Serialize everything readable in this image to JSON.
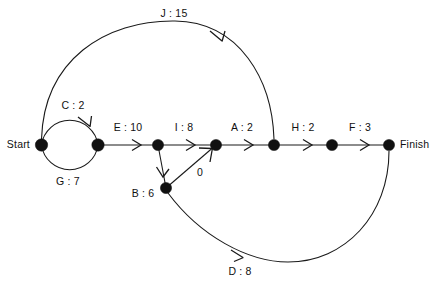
{
  "diagram": {
    "background_color": "#ffffff",
    "line_color": "#1a1a1a",
    "node_color": "#111111",
    "terminals": {
      "start_label": "Start",
      "finish_label": "Finish"
    },
    "nodes": [
      {
        "id": "start",
        "name": "start-node",
        "x": 41,
        "y": 145,
        "r": 6.0
      },
      {
        "id": "n2",
        "name": "node-2",
        "x": 98,
        "y": 145,
        "r": 6.0
      },
      {
        "id": "n3",
        "name": "node-3",
        "x": 158,
        "y": 145,
        "r": 5.5
      },
      {
        "id": "n4",
        "name": "node-4",
        "x": 216,
        "y": 145,
        "r": 5.5
      },
      {
        "id": "n5",
        "name": "node-5",
        "x": 274,
        "y": 145,
        "r": 5.5
      },
      {
        "id": "n6",
        "name": "node-6",
        "x": 332,
        "y": 145,
        "r": 5.5
      },
      {
        "id": "finish",
        "name": "finish-node",
        "x": 389,
        "y": 145,
        "r": 5.5
      },
      {
        "id": "nb",
        "name": "node-b",
        "x": 166,
        "y": 188,
        "r": 5.5
      }
    ],
    "edges": [
      {
        "id": "C",
        "label": "C : 2",
        "from": "start",
        "to": "n2",
        "shape": "arc-top-circle"
      },
      {
        "id": "G",
        "label": "G : 7",
        "from": "start",
        "to": "n2",
        "shape": "arc-bottom-circle"
      },
      {
        "id": "J",
        "label": "J : 15",
        "from": "start",
        "to": "n5",
        "shape": "arc-large-top"
      },
      {
        "id": "E",
        "label": "E : 10",
        "from": "n2",
        "to": "n3",
        "shape": "straight"
      },
      {
        "id": "I",
        "label": "I : 8",
        "from": "n3",
        "to": "n4",
        "shape": "straight"
      },
      {
        "id": "A",
        "label": "A : 2",
        "from": "n4",
        "to": "n5",
        "shape": "straight"
      },
      {
        "id": "H",
        "label": "H : 2",
        "from": "n5",
        "to": "n6",
        "shape": "straight"
      },
      {
        "id": "F",
        "label": "F : 3",
        "from": "n6",
        "to": "finish",
        "shape": "straight"
      },
      {
        "id": "B",
        "label": "B : 6",
        "from": "n3",
        "to": "nb",
        "shape": "straight-diagonal"
      },
      {
        "id": "Z",
        "label": "0",
        "from": "nb",
        "to": "n4",
        "shape": "straight-diagonal"
      },
      {
        "id": "D",
        "label": "D : 8",
        "from": "finish",
        "to": "nb",
        "shape": "arc-large-bottom"
      }
    ],
    "labels": [
      {
        "name": "edge-label-J",
        "text": "J : 15",
        "x": 174,
        "y": 8,
        "align": "center"
      },
      {
        "name": "edge-label-C",
        "text": "C : 2",
        "x": 73,
        "y": 100,
        "align": "center"
      },
      {
        "name": "edge-label-E",
        "text": "E : 10",
        "x": 128,
        "y": 122,
        "align": "center"
      },
      {
        "name": "edge-label-I",
        "text": "I : 8",
        "x": 184,
        "y": 122,
        "align": "center"
      },
      {
        "name": "edge-label-A",
        "text": "A : 2",
        "x": 242,
        "y": 122,
        "align": "center"
      },
      {
        "name": "edge-label-H",
        "text": "H : 2",
        "x": 303,
        "y": 122,
        "align": "center"
      },
      {
        "name": "edge-label-F",
        "text": "F : 3",
        "x": 360,
        "y": 122,
        "align": "center"
      },
      {
        "name": "edge-label-G",
        "text": "G : 7",
        "x": 68,
        "y": 176,
        "align": "center"
      },
      {
        "name": "edge-label-B",
        "text": "B : 6",
        "x": 143,
        "y": 188,
        "align": "center"
      },
      {
        "name": "edge-label-zero",
        "text": "0",
        "x": 200,
        "y": 167,
        "align": "center"
      },
      {
        "name": "edge-label-D",
        "text": "D : 8",
        "x": 240,
        "y": 266,
        "align": "center"
      },
      {
        "name": "terminal-label-start",
        "text": "Start",
        "x": 30,
        "y": 139,
        "align": "right"
      },
      {
        "name": "terminal-label-finish",
        "text": "Finish",
        "x": 400,
        "y": 139,
        "align": "left"
      }
    ]
  }
}
